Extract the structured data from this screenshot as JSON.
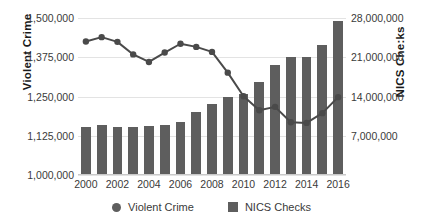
{
  "chart_data": {
    "type": "bar",
    "title": "",
    "xlabel": "",
    "ylabel": "Violent Crime",
    "y2label": "NICS Che:ks",
    "grid": true,
    "legend_position": "bottom",
    "categories": [
      2000,
      2001,
      2002,
      2003,
      2004,
      2005,
      2006,
      2007,
      2008,
      2009,
      2010,
      2011,
      2012,
      2013,
      2014,
      2015,
      2016
    ],
    "x_tick_labels": [
      "2000",
      "2002",
      "2004",
      "2006",
      "2008",
      "2010",
      "2012",
      "2014",
      "2016"
    ],
    "x_tick_values": [
      2000,
      2002,
      2004,
      2006,
      2008,
      2010,
      2012,
      2014,
      2016
    ],
    "ylim": [
      1000000,
      1500000
    ],
    "y_ticks": [
      1000000,
      1125000,
      1250000,
      1375000,
      1500000
    ],
    "y_tick_labels": [
      "1,000,000",
      "1,125,000",
      "1,250,000",
      "1,375,000",
      "1,500,000"
    ],
    "y2lim": [
      0,
      28000000
    ],
    "y2_ticks": [
      7000000,
      14000000,
      21000000,
      28000000
    ],
    "y2_tick_labels": [
      "7,000,000",
      "14,000,000",
      "21,000,000",
      "28,000,000"
    ],
    "series": [
      {
        "name": "NICS Checks",
        "type": "bar",
        "axis": "right",
        "color": "#5e5e5e",
        "values": [
          8500000,
          8900000,
          8500000,
          8500000,
          8700000,
          9000000,
          9500000,
          11200000,
          12700000,
          14000000,
          14400000,
          16500000,
          19600000,
          21100000,
          21000000,
          23100000,
          27500000
        ]
      },
      {
        "name": "Violent Crime",
        "type": "line",
        "axis": "left",
        "color": "#4a4a4a",
        "marker": "circle",
        "values": [
          1425000,
          1439000,
          1424000,
          1384000,
          1360000,
          1390000,
          1418000,
          1408000,
          1392000,
          1326000,
          1251000,
          1206000,
          1217000,
          1168000,
          1166000,
          1197000,
          1248000
        ]
      }
    ]
  },
  "legend": {
    "items": [
      {
        "label": "Violent Crime",
        "marker": "circle"
      },
      {
        "label": "NICS Checks",
        "marker": "square"
      }
    ]
  }
}
